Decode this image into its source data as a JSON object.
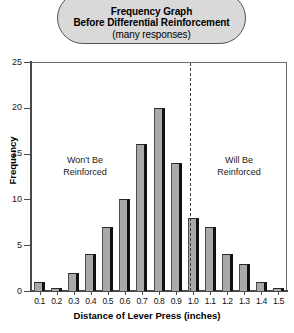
{
  "title": {
    "line1": "Frequency Graph",
    "line2": "Before Differential Reinforcement",
    "line3": "(many responses)"
  },
  "annotations": {
    "left_line1": "Won't Be",
    "left_line2": "Reinforced",
    "right_line1": "Will Be",
    "right_line2": "Reinforced"
  },
  "axes": {
    "y_title": "Frequency",
    "x_title": "Distance of Lever Press (inches)",
    "y_ticks": [
      "0",
      "5",
      "10",
      "15",
      "20",
      "25"
    ]
  },
  "colors": {
    "bar_fill": "#a9a9a9",
    "bar_shadow": "#111111",
    "title_box_fill": "#d9d9d9",
    "axis": "#4a4a4a",
    "divider": "#3b3b3b"
  },
  "chart_data": {
    "type": "bar",
    "title": "Frequency Graph Before Differential Reinforcement (many responses)",
    "xlabel": "Distance of Lever Press (inches)",
    "ylabel": "Frequency",
    "ylim": [
      0,
      25
    ],
    "ytick_step": 5,
    "grid": false,
    "legend": "none",
    "categories": [
      "0.1",
      "0.2",
      "0.3",
      "0.4",
      "0.5",
      "0.6",
      "0.7",
      "0.8",
      "0.9",
      "1.0",
      "1.1",
      "1.2",
      "1.3",
      "1.4",
      "1.5"
    ],
    "values": [
      1,
      0.3,
      2,
      4,
      7,
      10,
      16,
      20,
      14,
      8,
      7,
      4,
      3,
      1,
      0.3
    ],
    "annotations": [
      {
        "text": "Won't Be Reinforced",
        "region": "left-of-divider"
      },
      {
        "text": "Will Be Reinforced",
        "region": "right-of-divider"
      },
      {
        "type": "vertical-dashed-line",
        "x_between": [
          "0.9",
          "1.0"
        ]
      }
    ]
  }
}
